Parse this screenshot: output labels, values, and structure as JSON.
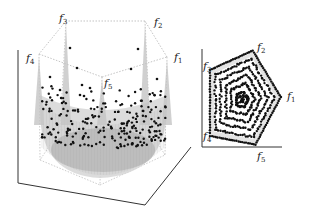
{
  "chart_data": [
    {
      "type": "scatter",
      "title": "",
      "panel": "left",
      "description": "3D surface with scattered solution points inside a pentagonal prism frame",
      "vertex_labels": [
        "f1",
        "f2",
        "f3",
        "f4",
        "f5"
      ],
      "vertices": {
        "f1": [
          167,
          57
        ],
        "f2": [
          145,
          21
        ],
        "f3": [
          66,
          21
        ],
        "f4": [
          39,
          54
        ],
        "f5": [
          102,
          77
        ]
      },
      "surface_color": "#c8c8c8",
      "point_color": "#111111",
      "frame_color": "#aaaaaa",
      "axis_color": "#333333"
    },
    {
      "type": "scatter",
      "title": "",
      "panel": "right",
      "description": "2D projection: concentric pentagonal rings of points",
      "vertex_labels": [
        "f1",
        "f2",
        "f3",
        "f4",
        "f5"
      ],
      "vertices": {
        "f1": [
          282,
          97
        ],
        "f2": [
          253,
          49
        ],
        "f3": [
          209,
          69
        ],
        "f4": [
          209,
          137
        ],
        "f5": [
          256,
          146
        ]
      },
      "rings": 6,
      "point_color": "#111111",
      "band_color": "#e4e4e4"
    }
  ],
  "labels": {
    "f1": "f",
    "f1_sub": "1",
    "f2": "f",
    "f2_sub": "2",
    "f3": "f",
    "f3_sub": "3",
    "f4": "f",
    "f4_sub": "4",
    "f5": "f",
    "f5_sub": "5"
  }
}
